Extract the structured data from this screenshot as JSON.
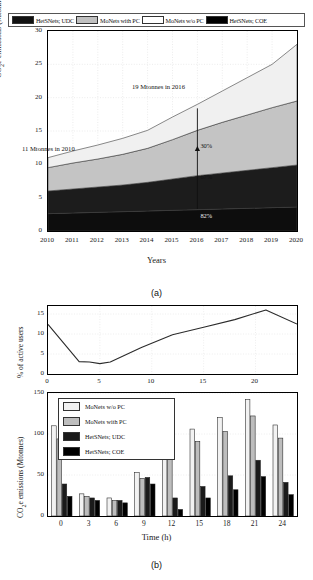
{
  "figure": {
    "panel_a_caption": "(a)",
    "panel_b_caption": "(b)"
  },
  "legend_a": {
    "items": [
      {
        "label": "HetSNets; UDC",
        "color": "#111111"
      },
      {
        "label": "MoNets with PC",
        "color": "#c0c0c0"
      },
      {
        "label": "MoNets w/o PC",
        "color": "#ffffff"
      },
      {
        "label": "HetSNets; COE",
        "color": "#000000"
      }
    ]
  },
  "chart_data": [
    {
      "type": "area",
      "id": "panel-a",
      "title": "",
      "xlabel": "Years",
      "ylabel": "CO2e emissions (Mtonnes)",
      "xlim": [
        2010,
        2020
      ],
      "ylim": [
        0,
        30
      ],
      "yticks": [
        0,
        5,
        10,
        15,
        20,
        25,
        30
      ],
      "xticks": [
        2010,
        2011,
        2012,
        2013,
        2014,
        2015,
        2016,
        2017,
        2018,
        2019,
        2020
      ],
      "grid": true,
      "stacked": true,
      "categories": [
        2010,
        2011,
        2012,
        2013,
        2014,
        2015,
        2016,
        2017,
        2018,
        2019,
        2020
      ],
      "series": [
        {
          "name": "HetSNets; COE",
          "color": "#0d0d0d",
          "values": [
            2.6,
            2.7,
            2.8,
            2.9,
            3.0,
            3.1,
            3.2,
            3.3,
            3.4,
            3.5,
            3.6
          ]
        },
        {
          "name": "HetSNets; UDC",
          "color": "#1c1c1c",
          "values": [
            3.4,
            3.6,
            3.8,
            4.0,
            4.3,
            4.7,
            5.1,
            5.4,
            5.7,
            6.0,
            6.3
          ]
        },
        {
          "name": "MoNets with PC",
          "color": "#c4c4c4",
          "values": [
            3.5,
            3.9,
            4.2,
            4.6,
            5.1,
            5.9,
            6.8,
            7.6,
            8.3,
            9.0,
            9.6
          ]
        },
        {
          "name": "MoNets w/o PC",
          "color": "#f0f0f0",
          "values": [
            1.5,
            1.8,
            2.1,
            2.4,
            2.7,
            3.4,
            3.9,
            4.7,
            5.6,
            6.5,
            8.5
          ]
        }
      ],
      "annotations": [
        {
          "text": "11 Mtonnes in 2010",
          "x": 2010,
          "y": 11
        },
        {
          "text": "19 Mtonnes in 2016",
          "x": 2016,
          "y": 19
        },
        {
          "text": "30%",
          "x": 2016,
          "y": 12.6
        },
        {
          "text": "67%",
          "x": 2016,
          "y": 8.0
        },
        {
          "text": "82%",
          "x": 2016,
          "y": 2.0
        }
      ]
    },
    {
      "type": "line",
      "id": "panel-b-top",
      "title": "",
      "xlabel": "",
      "ylabel": "% of active users",
      "xlim": [
        0,
        24
      ],
      "ylim": [
        0,
        17
      ],
      "yticks": [
        0,
        5,
        10,
        15
      ],
      "xticks": [
        0,
        5,
        10,
        15,
        20
      ],
      "grid": true,
      "x": [
        0,
        3,
        4,
        5,
        6,
        9,
        12,
        15,
        18,
        21,
        24
      ],
      "values": [
        12.4,
        3.1,
        3.0,
        2.6,
        3.0,
        6.6,
        9.8,
        11.7,
        13.6,
        16.0,
        12.5
      ]
    },
    {
      "type": "bar",
      "id": "panel-b-bottom",
      "title": "",
      "xlabel": "Time (h)",
      "ylabel": "CO2e emissions (Mtonnes)",
      "ylim": [
        0,
        150
      ],
      "yticks": [
        0,
        50,
        100,
        150
      ],
      "grid": true,
      "categories": [
        "0",
        "3",
        "6",
        "9",
        "12",
        "15",
        "18",
        "21",
        "24"
      ],
      "series": [
        {
          "name": "MoNets w/o PC",
          "color": "#f2f2f2",
          "values": [
            110,
            27,
            22,
            53,
            89,
            106,
            120,
            142,
            111
          ]
        },
        {
          "name": "MoNets with PC",
          "color": "#bdbdbd",
          "values": [
            94,
            24,
            19,
            46,
            76,
            91,
            103,
            122,
            95
          ]
        },
        {
          "name": "HetSNets; UDC",
          "color": "#1a1a1a",
          "values": [
            39,
            22,
            19,
            47,
            22,
            36,
            49,
            68,
            41
          ]
        },
        {
          "name": "HetSNets; COE",
          "color": "#000000",
          "values": [
            24,
            19,
            16,
            39,
            8,
            22,
            32,
            48,
            26
          ]
        }
      ]
    }
  ],
  "legend_b": {
    "items": [
      {
        "label": "MoNets w/o PC",
        "color": "#f2f2f2"
      },
      {
        "label": "MoNets with PC",
        "color": "#bdbdbd"
      },
      {
        "label": "HetSNets; UDC",
        "color": "#1a1a1a"
      },
      {
        "label": "HetSNets; COE",
        "color": "#000000"
      }
    ]
  }
}
